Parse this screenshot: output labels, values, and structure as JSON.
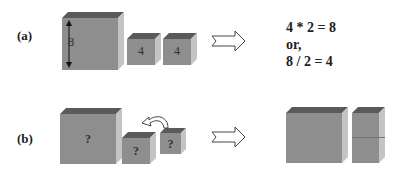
{
  "row_a": {
    "label": "(a)",
    "big_cube_label": "8",
    "small_cube_labels": [
      "4",
      "4"
    ],
    "equations": [
      "4 * 2 = 8",
      "or,",
      "8 / 2 = 4"
    ]
  },
  "row_b": {
    "label": "(b)",
    "big_cube_label": "?",
    "small_cube_labels": [
      "?",
      "?"
    ]
  },
  "colors": {
    "front": "#8e8e8e",
    "top": "#5a5a5a",
    "side": "#c4c4c4"
  }
}
